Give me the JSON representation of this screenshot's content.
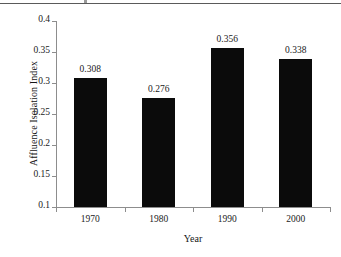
{
  "figure": {
    "top_rule": true,
    "background_color": "#ffffff",
    "bar_color": "#0b0b0b",
    "axis_color": "#8d8d8d",
    "text_color": "#1a1a1a"
  },
  "chart_data": {
    "type": "bar",
    "title": "",
    "categories": [
      "1970",
      "1980",
      "1990",
      "2000"
    ],
    "values": [
      0.308,
      0.276,
      0.356,
      0.338
    ],
    "value_labels": [
      "0.308",
      "0.276",
      "0.356",
      "0.338"
    ],
    "xlabel": "Year",
    "ylabel": "Affluence Isolation Index",
    "ylim": [
      0.1,
      0.4
    ],
    "yticks": [
      0.4,
      0.35,
      0.3,
      0.25,
      0.2,
      0.15,
      0.1
    ],
    "ytick_labels": [
      "0.4",
      "0.35",
      "0.3",
      "0.25",
      "0.2",
      "0.15",
      "0.1"
    ],
    "grid": false,
    "legend": false,
    "series": [
      {
        "name": "Affluence Isolation Index",
        "values": [
          0.308,
          0.276,
          0.356,
          0.338
        ]
      }
    ]
  }
}
